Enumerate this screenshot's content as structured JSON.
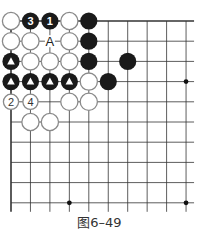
{
  "figure": {
    "caption": "图6–49"
  },
  "board": {
    "origin_x": 11,
    "origin_y": 21,
    "step_x": 19.45,
    "step_y": 20.2,
    "cols": 10,
    "rows": 10,
    "extend_right": 8,
    "extend_bottom": 9,
    "edges": [
      "left",
      "top"
    ],
    "colors": {
      "line": "#333333",
      "black_stone": "#1a1a1a",
      "white_fill": "#ffffff",
      "white_stroke": "#8a8a8a"
    },
    "star_points": [
      [
        9,
        3
      ],
      [
        3,
        9
      ],
      [
        9,
        9
      ]
    ],
    "stones": [
      {
        "c": 0,
        "r": 0,
        "color": "white"
      },
      {
        "c": 1,
        "r": 0,
        "color": "black",
        "label": "3"
      },
      {
        "c": 2,
        "r": 0,
        "color": "black",
        "label": "1"
      },
      {
        "c": 3,
        "r": 0,
        "color": "white"
      },
      {
        "c": 4,
        "r": 0,
        "color": "black"
      },
      {
        "c": 0,
        "r": 1,
        "color": "white"
      },
      {
        "c": 1,
        "r": 1,
        "color": "white"
      },
      {
        "c": 3,
        "r": 1,
        "color": "white"
      },
      {
        "c": 4,
        "r": 1,
        "color": "black"
      },
      {
        "c": 0,
        "r": 2,
        "color": "black",
        "mark": "triangle"
      },
      {
        "c": 1,
        "r": 2,
        "color": "white"
      },
      {
        "c": 2,
        "r": 2,
        "color": "white"
      },
      {
        "c": 3,
        "r": 2,
        "color": "white"
      },
      {
        "c": 4,
        "r": 2,
        "color": "black"
      },
      {
        "c": 6,
        "r": 2,
        "color": "black"
      },
      {
        "c": 0,
        "r": 3,
        "color": "black",
        "mark": "triangle"
      },
      {
        "c": 1,
        "r": 3,
        "color": "black",
        "mark": "triangle"
      },
      {
        "c": 2,
        "r": 3,
        "color": "black",
        "mark": "triangle"
      },
      {
        "c": 3,
        "r": 3,
        "color": "black",
        "mark": "triangle"
      },
      {
        "c": 4,
        "r": 3,
        "color": "white"
      },
      {
        "c": 5,
        "r": 3,
        "color": "black"
      },
      {
        "c": 0,
        "r": 4,
        "color": "white",
        "label": "2",
        "small": true
      },
      {
        "c": 1,
        "r": 4,
        "color": "white",
        "label": "4",
        "small": true
      },
      {
        "c": 3,
        "r": 4,
        "color": "white"
      },
      {
        "c": 4,
        "r": 4,
        "color": "white"
      },
      {
        "c": 1,
        "r": 5,
        "color": "white"
      },
      {
        "c": 2,
        "r": 5,
        "color": "white"
      }
    ],
    "point_labels": [
      {
        "c": 2,
        "r": 1,
        "text": "A"
      }
    ]
  }
}
